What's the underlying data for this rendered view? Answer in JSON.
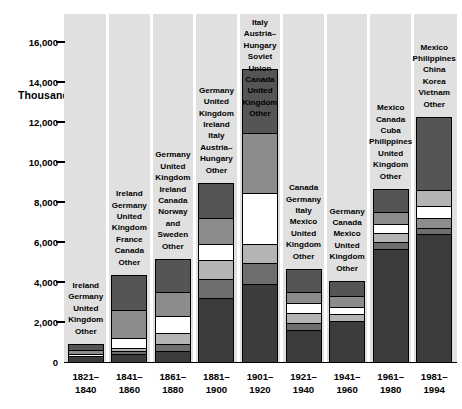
{
  "axis_title": "Thousands",
  "zero_label": "0",
  "y_ticks": [
    0,
    2000,
    4000,
    6000,
    8000,
    10000,
    12000,
    14000,
    16000
  ],
  "y_tick_labels": [
    "0",
    "2,000",
    "4,000",
    "6,000",
    "8,000",
    "10,000",
    "12,000",
    "14,000",
    "16,000"
  ],
  "colors": {
    "panel": "#e0e0e0",
    "gap": "#ffffff",
    "axis": "#000000",
    "seg_darkest": "#3c3c3c",
    "seg_dark": "#555555",
    "seg_mid": "#6e6e6e",
    "seg_medgray": "#8c8c8c",
    "seg_light": "#b4b4b4",
    "seg_lighter": "#c8c8c8",
    "seg_white": "#ffffff"
  },
  "chart_data": {
    "type": "bar",
    "subtype": "stacked",
    "title": "",
    "xlabel": "",
    "ylabel": "Thousands",
    "ylim": [
      0,
      17400
    ],
    "grid": false,
    "legend": "inline-labels-above-bars",
    "categories": [
      "1821–\n1840",
      "1841–\n1860",
      "1861–\n1880",
      "1881–\n1900",
      "1901–\n1920",
      "1921–\n1940",
      "1941–\n1960",
      "1961–\n1980",
      "1981–\n1994"
    ],
    "category_lines": [
      [
        "1821–",
        "1840"
      ],
      [
        "1841–",
        "1860"
      ],
      [
        "1861–",
        "1880"
      ],
      [
        "1881–",
        "1900"
      ],
      [
        "1901–",
        "1920"
      ],
      [
        "1921–",
        "1940"
      ],
      [
        "1941–",
        "1960"
      ],
      [
        "1961–",
        "1980"
      ],
      [
        "1981–",
        "1994"
      ]
    ],
    "totals": [
      850,
      4300,
      5100,
      8900,
      14600,
      4600,
      4000,
      8600,
      12200
    ],
    "bars": [
      {
        "period": "1821–1840",
        "total": 850,
        "labels_above": [
          "Ireland",
          "Germany",
          "United\nKingdom",
          "Other"
        ],
        "label_lines": [
          [
            "Ireland"
          ],
          [
            "Germany"
          ],
          [
            "United",
            "Kingdom"
          ],
          [
            "Other"
          ]
        ],
        "segments": [
          {
            "name": "Ireland",
            "value": 270,
            "color": "#555555"
          },
          {
            "name": "Germany",
            "value": 160,
            "color": "#8c8c8c"
          },
          {
            "name": "United Kingdom",
            "value": 120,
            "color": "#ffffff"
          },
          {
            "name": "Other",
            "value": 300,
            "color": "#3c3c3c"
          }
        ]
      },
      {
        "period": "1841–1860",
        "total": 4300,
        "labels_above": [
          "Ireland",
          "Germany",
          "United\nKingdom",
          "France",
          "Canada",
          "Other"
        ],
        "label_lines": [
          [
            "Ireland"
          ],
          [
            "Germany"
          ],
          [
            "United",
            "Kingdom"
          ],
          [
            "France"
          ],
          [
            "Canada"
          ],
          [
            "Other"
          ]
        ],
        "segments": [
          {
            "name": "Ireland",
            "value": 1700,
            "color": "#555555"
          },
          {
            "name": "Germany",
            "value": 1400,
            "color": "#8c8c8c"
          },
          {
            "name": "United Kingdom",
            "value": 500,
            "color": "#ffffff"
          },
          {
            "name": "France",
            "value": 170,
            "color": "#b4b4b4"
          },
          {
            "name": "Canada",
            "value": 120,
            "color": "#6e6e6e"
          },
          {
            "name": "Other",
            "value": 410,
            "color": "#3c3c3c"
          }
        ]
      },
      {
        "period": "1861–1880",
        "total": 5100,
        "labels_above": [
          "Germany",
          "United\nKingdom",
          "Ireland",
          "Canada",
          "Norway\nand\nSweden",
          "Other"
        ],
        "label_lines": [
          [
            "Germany"
          ],
          [
            "United",
            "Kingdom"
          ],
          [
            "Ireland"
          ],
          [
            "Canada"
          ],
          [
            "Norway",
            "and",
            "Sweden"
          ],
          [
            "Other"
          ]
        ],
        "segments": [
          {
            "name": "Germany",
            "value": 1600,
            "color": "#555555"
          },
          {
            "name": "United Kingdom",
            "value": 1200,
            "color": "#8c8c8c"
          },
          {
            "name": "Ireland",
            "value": 870,
            "color": "#ffffff"
          },
          {
            "name": "Canada",
            "value": 530,
            "color": "#b4b4b4"
          },
          {
            "name": "Norway and Sweden",
            "value": 330,
            "color": "#6e6e6e"
          },
          {
            "name": "Other",
            "value": 570,
            "color": "#3c3c3c"
          }
        ]
      },
      {
        "period": "1881–1900",
        "total": 8900,
        "labels_above": [
          "Germany",
          "United\nKingdom",
          "Ireland",
          "Italy",
          "Austria–\nHungary",
          "Other"
        ],
        "label_lines": [
          [
            "Germany"
          ],
          [
            "United",
            "Kingdom"
          ],
          [
            "Ireland"
          ],
          [
            "Italy"
          ],
          [
            "Austria–",
            "Hungary"
          ],
          [
            "Other"
          ]
        ],
        "segments": [
          {
            "name": "Germany",
            "value": 1700,
            "color": "#555555"
          },
          {
            "name": "United Kingdom",
            "value": 1300,
            "color": "#8c8c8c"
          },
          {
            "name": "Ireland",
            "value": 810,
            "color": "#ffffff"
          },
          {
            "name": "Italy",
            "value": 960,
            "color": "#b4b4b4"
          },
          {
            "name": "Austria–Hungary",
            "value": 950,
            "color": "#6e6e6e"
          },
          {
            "name": "Other",
            "value": 3180,
            "color": "#3c3c3c"
          }
        ]
      },
      {
        "period": "1901–1920",
        "total": 14600,
        "labels_above": [
          "Italy",
          "Austria–\nHungary",
          "Soviet\nUnion",
          "Canada",
          "United\nKingdom",
          "Other"
        ],
        "label_lines": [
          [
            "Italy"
          ],
          [
            "Austria–",
            "Hungary"
          ],
          [
            "Soviet",
            "Union"
          ],
          [
            "Canada"
          ],
          [
            "United",
            "Kingdom"
          ],
          [
            "Other"
          ]
        ],
        "segments": [
          {
            "name": "Italy",
            "value": 3150,
            "color": "#555555"
          },
          {
            "name": "Austria–Hungary",
            "value": 3000,
            "color": "#8c8c8c"
          },
          {
            "name": "Soviet Union",
            "value": 2550,
            "color": "#ffffff"
          },
          {
            "name": "Canada",
            "value": 950,
            "color": "#b4b4b4"
          },
          {
            "name": "United Kingdom",
            "value": 1050,
            "color": "#6e6e6e"
          },
          {
            "name": "Other",
            "value": 3900,
            "color": "#3c3c3c"
          }
        ]
      },
      {
        "period": "1921–1940",
        "total": 4600,
        "labels_above": [
          "Canada",
          "Germany",
          "Italy",
          "Mexico",
          "United\nKingdom",
          "Other"
        ],
        "label_lines": [
          [
            "Canada"
          ],
          [
            "Germany"
          ],
          [
            "Italy"
          ],
          [
            "Mexico"
          ],
          [
            "United",
            "Kingdom"
          ],
          [
            "Other"
          ]
        ],
        "segments": [
          {
            "name": "Canada",
            "value": 1100,
            "color": "#555555"
          },
          {
            "name": "Germany",
            "value": 530,
            "color": "#8c8c8c"
          },
          {
            "name": "Italy",
            "value": 520,
            "color": "#ffffff"
          },
          {
            "name": "Mexico",
            "value": 480,
            "color": "#b4b4b4"
          },
          {
            "name": "United Kingdom",
            "value": 380,
            "color": "#6e6e6e"
          },
          {
            "name": "Other",
            "value": 1590,
            "color": "#3c3c3c"
          }
        ]
      },
      {
        "period": "1941–1960",
        "total": 4000,
        "labels_above": [
          "Germany",
          "Canada",
          "Mexico",
          "United\nKingdom",
          "Other"
        ],
        "label_lines": [
          [
            "Germany"
          ],
          [
            "Canada"
          ],
          [
            "Mexico"
          ],
          [
            "United",
            "Kingdom"
          ],
          [
            "Other"
          ]
        ],
        "segments": [
          {
            "name": "Germany",
            "value": 700,
            "color": "#555555"
          },
          {
            "name": "Canada",
            "value": 550,
            "color": "#8c8c8c"
          },
          {
            "name": "Mexico",
            "value": 350,
            "color": "#ffffff"
          },
          {
            "name": "United Kingdom",
            "value": 350,
            "color": "#b4b4b4"
          },
          {
            "name": "Other",
            "value": 2050,
            "color": "#3c3c3c"
          }
        ]
      },
      {
        "period": "1961–1980",
        "total": 8600,
        "labels_above": [
          "Mexico",
          "Canada",
          "Cuba",
          "Philippines",
          "United\nKingdom",
          "Other"
        ],
        "label_lines": [
          [
            "Mexico"
          ],
          [
            "Canada"
          ],
          [
            "Cuba"
          ],
          [
            "Philippines"
          ],
          [
            "United",
            "Kingdom"
          ],
          [
            "Other"
          ]
        ],
        "segments": [
          {
            "name": "Mexico",
            "value": 1100,
            "color": "#555555"
          },
          {
            "name": "Canada",
            "value": 580,
            "color": "#8c8c8c"
          },
          {
            "name": "Cuba",
            "value": 470,
            "color": "#ffffff"
          },
          {
            "name": "Philippines",
            "value": 450,
            "color": "#b4b4b4"
          },
          {
            "name": "United Kingdom",
            "value": 350,
            "color": "#6e6e6e"
          },
          {
            "name": "Other",
            "value": 5650,
            "color": "#3c3c3c"
          }
        ]
      },
      {
        "period": "1981–1994",
        "total": 12200,
        "labels_above": [
          "Mexico",
          "Philippines",
          "China",
          "Korea",
          "Vietnam",
          "Other"
        ],
        "label_lines": [
          [
            "Mexico"
          ],
          [
            "Philippines"
          ],
          [
            "China"
          ],
          [
            "Korea"
          ],
          [
            "Vietnam"
          ],
          [
            "Other"
          ]
        ],
        "segments": [
          {
            "name": "Mexico",
            "value": 3600,
            "color": "#555555"
          },
          {
            "name": "Philippines",
            "value": 780,
            "color": "#b4b4b4"
          },
          {
            "name": "China",
            "value": 620,
            "color": "#ffffff"
          },
          {
            "name": "Korea",
            "value": 480,
            "color": "#8c8c8c"
          },
          {
            "name": "Vietnam",
            "value": 300,
            "color": "#6e6e6e"
          },
          {
            "name": "Other",
            "value": 6420,
            "color": "#3c3c3c"
          }
        ]
      }
    ]
  }
}
